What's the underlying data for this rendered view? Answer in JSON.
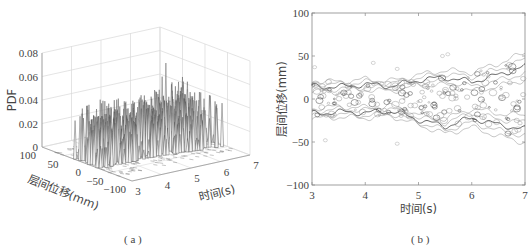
{
  "chart_data": [
    {
      "id": "a",
      "type": "surface3d",
      "caption": "( a )",
      "zlabel": "PDF",
      "ylabel": "层间位移(mm)",
      "xlabel": "时间(s)",
      "zticks": [
        "0",
        "0.02",
        "0.04",
        "0.06",
        "0.08"
      ],
      "zlim": [
        0,
        0.08
      ],
      "yticks": [
        "100",
        "50",
        "0",
        "−50",
        "−100"
      ],
      "ylim": [
        -100,
        100
      ],
      "xticks": [
        "3",
        "4",
        "5",
        "6",
        "7"
      ],
      "xlim": [
        3,
        7
      ],
      "grid": true,
      "description": "Probability density of inter-story displacement over time; dense spiky ridges concentrated roughly between -40 and 40 mm displacement, peaks mostly 0.02–0.05, maximum spike near 0.07 around t≈5.8 s"
    },
    {
      "id": "b",
      "type": "contour",
      "caption": "( b )",
      "ylabel": "层间位移(mm)",
      "xlabel": "时间(s)",
      "yticks": [
        "100",
        "50",
        "0",
        "−50",
        "−100"
      ],
      "ylim": [
        -100,
        100
      ],
      "xticks": [
        "3",
        "4",
        "5",
        "6",
        "7"
      ],
      "xlim": [
        3,
        7
      ],
      "grid": false,
      "description": "Contour plot of the PDF; two oscillating bands near +15 mm and −15 mm widening after t≈5 s, reaching about ±40 mm by t≈7 s",
      "upper_band": {
        "x": [
          3,
          3.5,
          4,
          4.5,
          5,
          5.5,
          6,
          6.5,
          7
        ],
        "y": [
          15,
          14,
          17,
          15,
          22,
          25,
          20,
          28,
          38
        ]
      },
      "lower_band": {
        "x": [
          3,
          3.5,
          4,
          4.5,
          5,
          5.5,
          6,
          6.5,
          7
        ],
        "y": [
          -17,
          -15,
          -16,
          -14,
          -24,
          -32,
          -22,
          -30,
          -35
        ]
      }
    }
  ]
}
